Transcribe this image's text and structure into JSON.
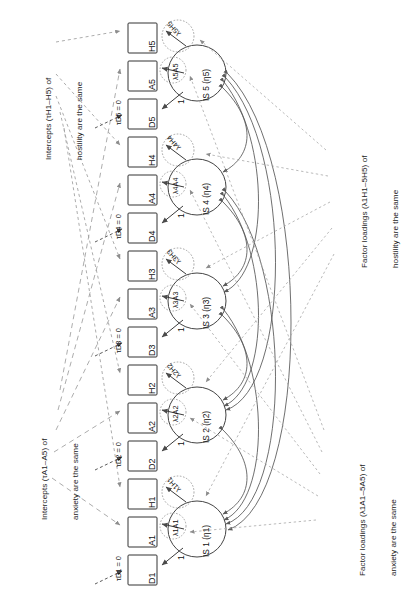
{
  "figure": {
    "type": "sem-path-diagram",
    "orientation": "rotated-90-ccw"
  },
  "annotations": [
    {
      "id": "ann-intercepts-hostility",
      "line1": "Intercepts (τH1–H5) of",
      "line2": "hostility are the same"
    },
    {
      "id": "ann-intercepts-anxiety",
      "line1": "Intercepts (τA1–A5) of",
      "line2": "anxiety are the same"
    },
    {
      "id": "ann-loadings-hostility",
      "line1": "Factor loadings (λ1H1–5H5) of",
      "line2": "hostility are the same"
    },
    {
      "id": "ann-loadings-anxiety",
      "line1": "Factor loadings (λ1A1–5A5) of",
      "line2": "anxiety are the same"
    }
  ],
  "indicators": [
    {
      "id": "H5",
      "label": "H5"
    },
    {
      "id": "A5",
      "label": "A5"
    },
    {
      "id": "D5",
      "label": "D5"
    },
    {
      "id": "H4",
      "label": "H4"
    },
    {
      "id": "A4",
      "label": "A4"
    },
    {
      "id": "D4",
      "label": "D4"
    },
    {
      "id": "H3",
      "label": "H3"
    },
    {
      "id": "A3",
      "label": "A3"
    },
    {
      "id": "D3",
      "label": "D3"
    },
    {
      "id": "H2",
      "label": "H2"
    },
    {
      "id": "A2",
      "label": "A2"
    },
    {
      "id": "D2",
      "label": "D2"
    },
    {
      "id": "H1",
      "label": "H1"
    },
    {
      "id": "A1",
      "label": "A1"
    },
    {
      "id": "D1",
      "label": "D1"
    }
  ],
  "factors": [
    {
      "id": "IS5",
      "label": "IS 5 (η5)"
    },
    {
      "id": "IS4",
      "label": "IS 4 (η4)"
    },
    {
      "id": "IS3",
      "label": "IS 3 (η3)"
    },
    {
      "id": "IS2",
      "label": "IS 2 (η2)"
    },
    {
      "id": "IS1",
      "label": "IS 1 (η1)"
    }
  ],
  "loadings": [
    {
      "id": "l5H5",
      "label": "λ5H5"
    },
    {
      "id": "l5A5",
      "label": "λ5A5"
    },
    {
      "id": "l4H4",
      "label": "λ4H4"
    },
    {
      "id": "l4A4",
      "label": "λ4A4"
    },
    {
      "id": "l3H3",
      "label": "λ3H3"
    },
    {
      "id": "l3A3",
      "label": "λ3A3"
    },
    {
      "id": "l2H2",
      "label": "λ2H2"
    },
    {
      "id": "l2A2",
      "label": "λ2A2"
    },
    {
      "id": "l1H1",
      "label": "λ1H1"
    },
    {
      "id": "l1A1",
      "label": "λ1A1"
    }
  ],
  "fixed_loadings": [
    {
      "id": "one5",
      "label": "1"
    },
    {
      "id": "one4",
      "label": "1"
    },
    {
      "id": "one3",
      "label": "1"
    },
    {
      "id": "one2",
      "label": "1"
    },
    {
      "id": "one1",
      "label": "1"
    }
  ],
  "tau_constraints": [
    {
      "id": "tauD5",
      "label": "τD5 = 0"
    },
    {
      "id": "tauD4",
      "label": "τD4 = 0"
    },
    {
      "id": "tauD3",
      "label": "τD3 = 0"
    },
    {
      "id": "tauD2",
      "label": "τD2 = 0"
    },
    {
      "id": "tauD1",
      "label": "τD1 = 0"
    }
  ],
  "colors": {
    "stroke": "#3a3a3a",
    "light": "#9a9a9a",
    "lighter": "#b4b4b4",
    "background": "#ffffff"
  }
}
